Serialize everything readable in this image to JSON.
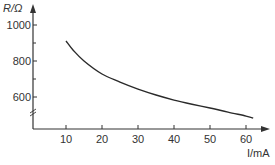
{
  "chart_data": {
    "type": "line",
    "title": "",
    "xlabel": "I/mA",
    "ylabel": "R/Ω",
    "x_ticks": [
      10,
      20,
      30,
      40,
      50,
      60
    ],
    "y_ticks": [
      600,
      800,
      1000
    ],
    "y_minor_ticks": [
      700,
      900
    ],
    "y_axis_break": true,
    "xlim": [
      0,
      67
    ],
    "ylim": [
      420,
      1060
    ],
    "grid": false,
    "legend": null,
    "series": [
      {
        "name": "R vs I",
        "x": [
          10,
          12,
          15,
          20,
          25,
          30,
          35,
          40,
          45,
          50,
          55,
          60,
          62
        ],
        "values": [
          911,
          860,
          800,
          728,
          683,
          644,
          611,
          583,
          560,
          539,
          516,
          494,
          483
        ]
      }
    ]
  },
  "labels": {
    "y_axis": "R/Ω",
    "x_axis": "I/mA",
    "x_ticks": [
      "10",
      "20",
      "30",
      "40",
      "50",
      "60"
    ],
    "y_ticks": [
      "1000",
      "800",
      "600"
    ]
  },
  "colors": {
    "axis": "#333333",
    "curve": "#2a2a2a",
    "text": "#333333"
  }
}
